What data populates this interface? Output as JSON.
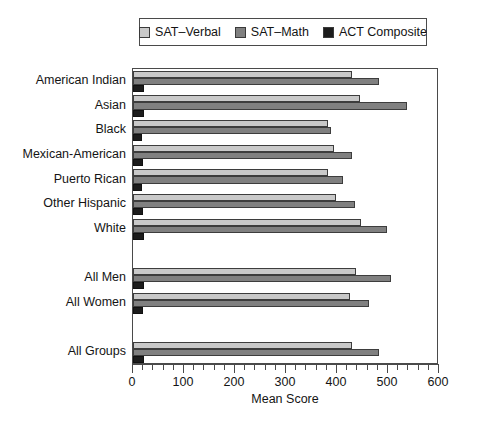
{
  "chart_data": {
    "type": "bar",
    "orientation": "horizontal",
    "title": "",
    "xlabel": "Mean Score",
    "ylabel": "",
    "xlim": [
      0,
      600
    ],
    "xticks": [
      0,
      100,
      200,
      300,
      400,
      500,
      600
    ],
    "xtick_labels": [
      "0",
      "100",
      "200",
      "300",
      "400",
      "500",
      "600"
    ],
    "minor_tick_step": 20,
    "grid": false,
    "legend_position": "top",
    "categories": [
      "American Indian",
      "Asian",
      "Black",
      "Mexican-American",
      "Puerto Rican",
      "Other Hispanic",
      "White",
      "All Men",
      "All Women",
      "All Groups"
    ],
    "group_gaps_after": [
      "White",
      "All Women"
    ],
    "series": [
      {
        "name": "SAT–Verbal",
        "color": "#c9c9c9",
        "values": [
          429,
          446,
          382,
          394,
          383,
          398,
          448,
          437,
          426,
          430
        ]
      },
      {
        "name": "SAT–Math",
        "color": "#808080",
        "values": [
          482,
          538,
          388,
          430,
          411,
          435,
          498,
          505,
          463,
          482
        ]
      },
      {
        "name": "ACT Composite",
        "color": "#1c1c1c",
        "values": [
          21,
          21,
          17,
          19,
          18,
          19,
          22,
          21,
          20,
          21
        ]
      }
    ]
  },
  "legend": {
    "entries": [
      {
        "label": "SAT–Verbal",
        "swatch": "legend-swatch-verbal"
      },
      {
        "label": "SAT–Math",
        "swatch": "legend-swatch-math"
      },
      {
        "label": "ACT Composite",
        "swatch": "legend-swatch-act"
      }
    ]
  },
  "axis": {
    "x_title": "Mean Score"
  },
  "colors": {
    "verbal": "#c9c9c9",
    "math": "#808080",
    "act": "#1c1c1c",
    "frame": "#4a4a4a",
    "text": "#141414",
    "background": "#ffffff"
  }
}
